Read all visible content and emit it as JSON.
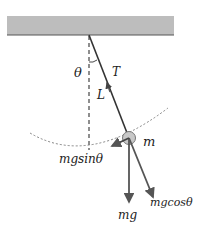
{
  "diagram": {
    "colors": {
      "ceiling_fill": "#bdbdbd",
      "ceiling_edge": "#555555",
      "string": "#333333",
      "arrow": "#555555",
      "dashed": "#444444",
      "bob_fill": "#c8c8c8",
      "bob_stroke": "#777777",
      "label": "#222222"
    },
    "labels": {
      "theta": "θ",
      "tension": "T",
      "length": "L",
      "mass": "m",
      "tangential_force": "mgsinθ",
      "weight": "mg",
      "radial_force": "mgcosθ"
    },
    "elements": {
      "ceiling": "fixed support",
      "pivot": "pivot point",
      "string": "pendulum string",
      "vertical_reference": "dashed vertical line",
      "swing_arc": "dashed swing path",
      "bob": "pendulum bob"
    }
  }
}
